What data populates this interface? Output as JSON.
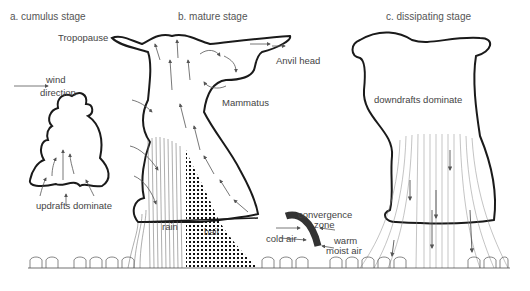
{
  "stages": {
    "a": {
      "title": "a. cumulus stage",
      "caption": "updrafts dominate"
    },
    "b": {
      "title": "b. mature stage",
      "tropopause": "Tropopause",
      "anvil": "Anvil head",
      "mammatus": "Mammatus",
      "rain": "rain",
      "hail": "hail",
      "cold_air": "cold air",
      "convergence_1": "convergence",
      "convergence_2": "zone",
      "warm_1": "warm",
      "warm_2": "moist air"
    },
    "c": {
      "title": "c. dissipating stage",
      "caption": "downdrafts dominate"
    }
  },
  "wind": {
    "line1": "wind",
    "line2": "direction"
  },
  "colors": {
    "outline": "#1a1a1a",
    "arrow": "#555555",
    "text": "#444444",
    "front": "#333333"
  }
}
